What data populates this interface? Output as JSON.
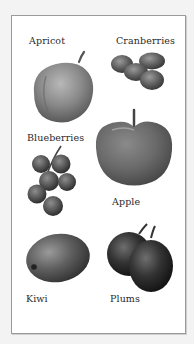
{
  "illustration": {
    "items": [
      {
        "label": "Apricot"
      },
      {
        "label": "Cranberries"
      },
      {
        "label": "Blueberries"
      },
      {
        "label": "Apple"
      },
      {
        "label": "Kiwi"
      },
      {
        "label": "Plums"
      }
    ]
  },
  "colors": {
    "background": "#f3f3f3",
    "panel": "#ffffff",
    "border": "#9a9a9a",
    "text": "#2a2a2a"
  }
}
